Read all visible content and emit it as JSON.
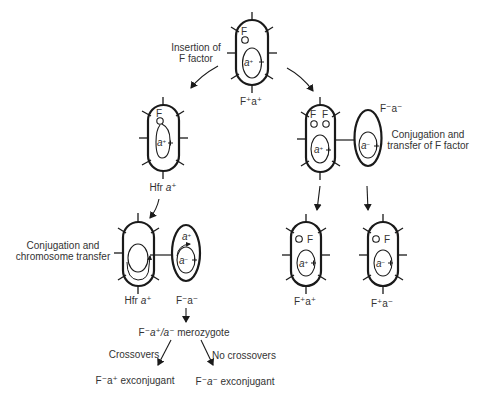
{
  "colors": {
    "line": "#1a1a1a",
    "text": "#333333",
    "background": "#ffffff"
  },
  "cells": {
    "top": {
      "label": "F⁺a⁺",
      "plasmid": "F",
      "chromosome_gene": "a⁺"
    },
    "hfr": {
      "label_prefix": "Hfr",
      "label_gene": "a⁺",
      "plasmid": "F",
      "chromosome_gene": "a⁺"
    },
    "donor_f_plus": {
      "plasmids": [
        "F",
        "F"
      ],
      "chromosome_gene": "a⁺"
    },
    "recipient_f_minus": {
      "label": "F⁻a⁻",
      "chromosome_gene": "a⁻"
    },
    "hfr_conjugating": {
      "label_prefix": "Hfr",
      "label_gene": "a⁺"
    },
    "recipient_conjugating": {
      "label": "F⁻a⁻",
      "transferred_gene": "a⁺",
      "chromosome_gene": "a⁻"
    },
    "progeny_1": {
      "label": "F⁺a⁺",
      "plasmid": "F",
      "chromosome_gene": "a⁺"
    },
    "progeny_2": {
      "label": "F⁺a⁻",
      "plasmid": "F",
      "chromosome_gene": "a⁻"
    }
  },
  "annotations": {
    "insertion_line1": "Insertion of",
    "insertion_line2": "F factor",
    "conj_f_line1": "Conjugation and",
    "conj_f_line2": "transfer of F factor",
    "conj_chrom_line1": "Conjugation and",
    "conj_chrom_line2": "chromosome transfer",
    "merozygote_prefix": "F⁻",
    "merozygote_genes": "a⁺/a⁻",
    "merozygote_suffix": "merozygote",
    "crossovers": "Crossovers",
    "no_crossovers": "No crossovers",
    "exconj_plus_prefix": "F⁻a⁺",
    "exconj_plus_suffix": "exconjugant",
    "exconj_minus_prefix": "F⁻",
    "exconj_minus_gene": "a⁻",
    "exconj_minus_suffix": "exconjugant"
  }
}
